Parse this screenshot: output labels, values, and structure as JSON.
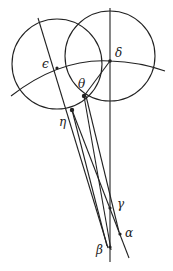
{
  "diagram": {
    "stroke_color": "#222222",
    "background": "#ffffff",
    "labels": {
      "delta": "δ",
      "epsilon": "ϵ",
      "theta": "θ",
      "eta": "η",
      "gamma": "γ",
      "alpha": "α",
      "beta": "β"
    },
    "points": {
      "delta": [
        110,
        61
      ],
      "epsilon": [
        57,
        68
      ],
      "theta": [
        84,
        96
      ],
      "eta": [
        72,
        110
      ],
      "gamma": [
        110,
        208
      ],
      "alpha": [
        120,
        234
      ],
      "beta": [
        110,
        247
      ]
    },
    "circles": [
      {
        "name": "left-circle",
        "cx": 57,
        "cy": 64,
        "r": 45
      },
      {
        "name": "right-circle",
        "cx": 110,
        "cy": 56,
        "r": 45
      }
    ]
  }
}
